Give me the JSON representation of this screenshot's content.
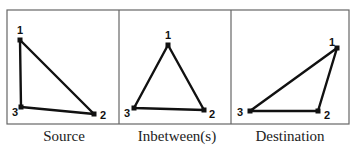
{
  "panels": [
    {
      "caption": "Source",
      "points": [
        [
          20,
          40,
          "1"
        ],
        [
          94,
          114,
          "2"
        ],
        [
          21,
          107,
          "3"
        ]
      ]
    },
    {
      "caption": "Inbetween(s)",
      "points": [
        [
          168,
          45,
          "1"
        ],
        [
          204,
          110,
          "2"
        ],
        [
          134,
          108,
          "3"
        ]
      ]
    },
    {
      "caption": "Destination",
      "points": [
        [
          337,
          48,
          "1"
        ],
        [
          318,
          111,
          "2"
        ],
        [
          250,
          111,
          "3"
        ]
      ]
    }
  ],
  "colors": {
    "line": "#111111",
    "frame": "#555555"
  }
}
